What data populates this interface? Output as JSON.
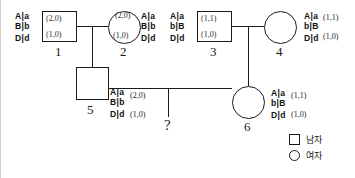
{
  "diagram": {
    "type": "pedigree-haplotype-chart",
    "generations": 2,
    "legend": {
      "items": [
        {
          "symbol": "square",
          "label": "남자"
        },
        {
          "symbol": "circle",
          "label": "여자"
        }
      ]
    },
    "unknown_offspring": {
      "marker": "?"
    },
    "individuals": [
      {
        "id": "1",
        "sex": "male",
        "symbol": "square",
        "genotype": {
          "locus_a_left": "A",
          "locus_a_right": "a",
          "locus_b_left": "B",
          "locus_b_right": "b",
          "locus_d_left": "D",
          "locus_d_right": "d"
        },
        "values": {
          "top": "(2,0)",
          "bottom": "(1,0)"
        },
        "values_position": "inside"
      },
      {
        "id": "2",
        "sex": "female",
        "symbol": "circle",
        "genotype": {
          "locus_a_left": "A",
          "locus_a_right": "a",
          "locus_b_left": "B",
          "locus_b_right": "b",
          "locus_d_left": "D",
          "locus_d_right": "d"
        },
        "values": {
          "top": "(2,0)",
          "bottom": "(1,0)"
        },
        "values_position": "inside"
      },
      {
        "id": "3",
        "sex": "male",
        "symbol": "square",
        "genotype": {
          "locus_a_left": "A",
          "locus_a_right": "a",
          "locus_b_left": "b",
          "locus_b_right": "B",
          "locus_d_left": "D",
          "locus_d_right": "d"
        },
        "values": {
          "top": "(1,1)",
          "bottom": "(1,0)"
        },
        "values_position": "inside"
      },
      {
        "id": "4",
        "sex": "female",
        "symbol": "circle",
        "genotype": {
          "locus_a_left": "A",
          "locus_a_right": "a",
          "locus_b_left": "b",
          "locus_b_right": "B",
          "locus_d_left": "D",
          "locus_d_right": "d"
        },
        "values": {
          "top": "(1,1)",
          "bottom": "(1,0)"
        },
        "values_position": "right"
      },
      {
        "id": "5",
        "sex": "male",
        "symbol": "square",
        "genotype": {
          "locus_a_left": "A",
          "locus_a_right": "a",
          "locus_b_left": "B",
          "locus_b_right": "b",
          "locus_d_left": "D",
          "locus_d_right": "d"
        },
        "values": {
          "top": "(2,0)",
          "bottom": "(1,0)"
        },
        "values_position": "right"
      },
      {
        "id": "6",
        "sex": "female",
        "symbol": "circle",
        "genotype": {
          "locus_a_left": "A",
          "locus_a_right": "a",
          "locus_b_left": "b",
          "locus_b_right": "B",
          "locus_d_left": "D",
          "locus_d_right": "d"
        },
        "values": {
          "top": "(1,1)",
          "bottom": "(1,0)"
        },
        "values_position": "right"
      }
    ]
  }
}
